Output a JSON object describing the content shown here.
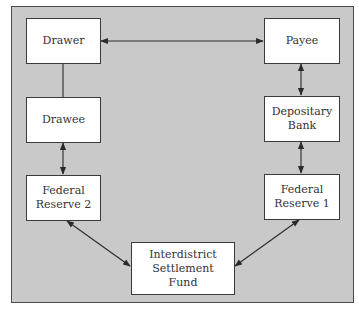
{
  "diagram": {
    "nodes": [
      {
        "id": "drawer",
        "lines": [
          "Drawer"
        ]
      },
      {
        "id": "payee",
        "lines": [
          "Payee"
        ]
      },
      {
        "id": "drawee",
        "lines": [
          "Drawee"
        ]
      },
      {
        "id": "depositary-bank",
        "lines": [
          "Depositary",
          "Bank"
        ]
      },
      {
        "id": "federal-reserve-2",
        "lines": [
          "Federal",
          "Reserve 2"
        ]
      },
      {
        "id": "federal-reserve-1",
        "lines": [
          "Federal",
          "Reserve 1"
        ]
      },
      {
        "id": "interdistrict-settlement-fund",
        "lines": [
          "Interdistrict",
          "Settlement",
          "Fund"
        ]
      }
    ],
    "edges": [
      {
        "from": "drawer",
        "to": "payee",
        "type": "bidirectional-arrow"
      },
      {
        "from": "drawer",
        "to": "drawee",
        "type": "line"
      },
      {
        "from": "payee",
        "to": "depositary-bank",
        "type": "bidirectional-arrow"
      },
      {
        "from": "drawee",
        "to": "federal-reserve-2",
        "type": "bidirectional-arrow"
      },
      {
        "from": "depositary-bank",
        "to": "federal-reserve-1",
        "type": "bidirectional-arrow"
      },
      {
        "from": "federal-reserve-2",
        "to": "interdistrict-settlement-fund",
        "type": "bidirectional-arrow"
      },
      {
        "from": "federal-reserve-1",
        "to": "interdistrict-settlement-fund",
        "type": "bidirectional-arrow"
      }
    ],
    "colors": {
      "background": "#c9c9c9",
      "box_fill": "#ffffff",
      "stroke": "#333333"
    }
  }
}
